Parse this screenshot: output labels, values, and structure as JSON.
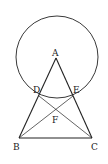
{
  "diagram": {
    "type": "geometry",
    "circle": {
      "center": [
        57,
        57
      ],
      "radius": 41
    },
    "points": {
      "A": {
        "label": "A",
        "x": 56,
        "y": 58
      },
      "B": {
        "label": "B",
        "x": 19,
        "y": 138
      },
      "C": {
        "label": "C",
        "x": 92,
        "y": 138
      },
      "D": {
        "label": "D",
        "x": 39,
        "y": 96
      },
      "E": {
        "label": "E",
        "x": 73,
        "y": 96
      },
      "F": {
        "label": "F",
        "x": 56,
        "y": 110
      }
    },
    "segments": [
      "AB",
      "AC",
      "BC",
      "BE",
      "CD"
    ],
    "stroke_color": "#222222"
  }
}
